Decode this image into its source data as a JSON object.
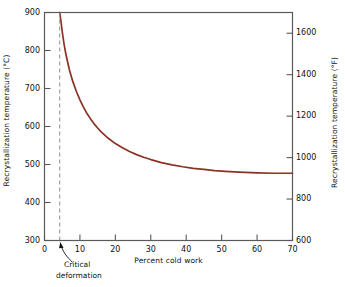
{
  "chart_data": {
    "type": "line",
    "title": "",
    "xlabel": "Percent cold work",
    "ylabel": "Recrystallization temperature (°C)",
    "ylabel_right": "Recrystallization temperature (°F)",
    "xlim": [
      0,
      70
    ],
    "ylim": [
      300,
      900
    ],
    "ylim_right": [
      600,
      1700
    ],
    "grid": false,
    "legend": null,
    "xticks": [
      0,
      10,
      20,
      30,
      40,
      50,
      60,
      70
    ],
    "xtick_labels": [
      "0",
      "10",
      "20",
      "30",
      "40",
      "50",
      "60",
      "70"
    ],
    "yticks": [
      300,
      400,
      500,
      600,
      700,
      800,
      900
    ],
    "ytick_labels": [
      "300",
      "400",
      "500",
      "600",
      "700",
      "800",
      "900"
    ],
    "yticks_right": [
      600,
      800,
      1000,
      1200,
      1400,
      1600
    ],
    "ytick_labels_right": [
      "600",
      "800",
      "1000",
      "1200",
      "1400",
      "1600"
    ],
    "series": [
      {
        "name": "Recrystallization temperature",
        "color": "#8a3324",
        "x": [
          4.3,
          4.6,
          5,
          5.5,
          6,
          7,
          8,
          9,
          10,
          11,
          12,
          13,
          14,
          15,
          16,
          18,
          20,
          22,
          24,
          26,
          28,
          30,
          33,
          36,
          39,
          42,
          45,
          48,
          51,
          55,
          60,
          65,
          70
        ],
        "y": [
          900,
          880,
          850,
          818,
          792,
          750,
          718,
          692,
          670,
          651,
          634,
          620,
          607,
          596,
          586,
          569,
          555,
          544,
          534,
          526,
          519,
          513,
          505,
          499,
          494,
          490,
          487,
          484,
          482,
          480,
          478,
          477,
          477
        ]
      }
    ],
    "annotations": [
      {
        "name": "critical-deformation",
        "text_line1": "Critical",
        "text_line2": "deformation",
        "x_value": 4.3,
        "arrow": true
      }
    ],
    "reference_lines": [
      {
        "name": "critical-deformation-line",
        "orientation": "vertical",
        "x_value": 4.3,
        "style": "dashed",
        "color": "#8c8c8c"
      }
    ]
  }
}
